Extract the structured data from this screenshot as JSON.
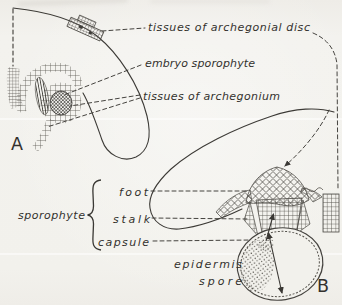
{
  "figure": {
    "caption_context": "liverwort sporophyte development diagram",
    "panel_a_letter": "A",
    "panel_b_letter": "B",
    "labels": {
      "archegonial_disc": "tissues of archegonial disc",
      "embryo_sporophyte": "embryo sporophyte",
      "archegonium": "tissues of archegonium",
      "foot": "foot",
      "sporophyte": "sporophyte",
      "stalk": "stalk",
      "capsule": "capsule",
      "epidermis": "epidermis",
      "spore": "spore"
    },
    "colors": {
      "paper": "#f2f1ec",
      "ink": "#35332f",
      "leader_line": "#45433f",
      "cell_texture": "#55524c"
    }
  }
}
